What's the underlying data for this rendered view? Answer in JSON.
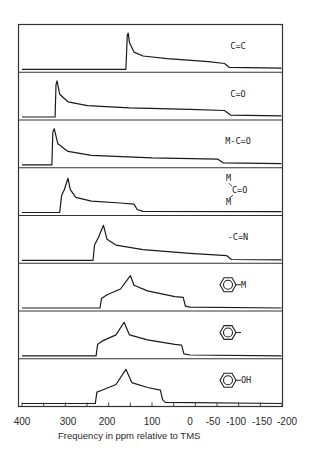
{
  "chart_data": {
    "type": "line",
    "title": "",
    "xlabel": "Frequency in ppm relative to TMS",
    "ylabel": "",
    "x_axis_reversed": true,
    "xlim": [
      400,
      -200
    ],
    "tick_labels": [
      "400",
      "300",
      "200",
      "100",
      "0",
      "-50",
      "-100",
      "-150",
      "-200"
    ],
    "tick_values": [
      400,
      300,
      200,
      100,
      0,
      -50,
      -100,
      -150,
      -200
    ],
    "minor_tick_count": 13,
    "grid": false,
    "legend": "none",
    "series": [
      {
        "name": "C=C",
        "label": "C=C",
        "label_kind": "text",
        "points": [
          [
            400,
            0
          ],
          [
            158,
            0
          ],
          [
            155,
            0.9
          ],
          [
            153,
            0.95
          ],
          [
            150,
            0.7
          ],
          [
            140,
            0.45
          ],
          [
            120,
            0.35
          ],
          [
            60,
            0.28
          ],
          [
            -40,
            0.2
          ],
          [
            -75,
            0.15
          ],
          [
            -85,
            0.05
          ],
          [
            -200,
            0.03
          ]
        ]
      },
      {
        "name": "C=O",
        "label": "C=O",
        "label_kind": "text",
        "points": [
          [
            400,
            0
          ],
          [
            328,
            0
          ],
          [
            326,
            0.85
          ],
          [
            324,
            0.95
          ],
          [
            318,
            0.6
          ],
          [
            300,
            0.4
          ],
          [
            250,
            0.3
          ],
          [
            150,
            0.24
          ],
          [
            0,
            0.2
          ],
          [
            -75,
            0.17
          ],
          [
            -88,
            0.05
          ],
          [
            -200,
            0.03
          ]
        ]
      },
      {
        "name": "M-C=O",
        "label": "M-C=O",
        "label_kind": "text",
        "points": [
          [
            400,
            0
          ],
          [
            335,
            0
          ],
          [
            333,
            0.85
          ],
          [
            330,
            0.95
          ],
          [
            322,
            0.55
          ],
          [
            300,
            0.35
          ],
          [
            240,
            0.25
          ],
          [
            100,
            0.18
          ],
          [
            -60,
            0.15
          ],
          [
            -72,
            0.05
          ],
          [
            -200,
            0.03
          ]
        ]
      },
      {
        "name": "M2C=O",
        "label": "M\\C=O/M",
        "label_kind": "bridged",
        "points": [
          [
            400,
            0
          ],
          [
            318,
            0
          ],
          [
            314,
            0.45
          ],
          [
            308,
            0.6
          ],
          [
            300,
            0.9
          ],
          [
            294,
            0.6
          ],
          [
            280,
            0.4
          ],
          [
            240,
            0.3
          ],
          [
            170,
            0.25
          ],
          [
            140,
            0.22
          ],
          [
            133,
            0.08
          ],
          [
            120,
            0.03
          ],
          [
            -200,
            0.02
          ]
        ]
      },
      {
        "name": "-C≡N",
        "label": "-C=N",
        "label_kind": "text",
        "points": [
          [
            400,
            0
          ],
          [
            236,
            0
          ],
          [
            232,
            0.4
          ],
          [
            222,
            0.6
          ],
          [
            209,
            0.92
          ],
          [
            200,
            0.55
          ],
          [
            180,
            0.4
          ],
          [
            120,
            0.28
          ],
          [
            0,
            0.18
          ],
          [
            -80,
            0.12
          ],
          [
            -90,
            0.02
          ],
          [
            -200,
            0.01
          ]
        ]
      },
      {
        "name": "Ph-M",
        "label": "M",
        "label_kind": "benzene",
        "points": [
          [
            400,
            0
          ],
          [
            218,
            0
          ],
          [
            214,
            0.25
          ],
          [
            200,
            0.35
          ],
          [
            170,
            0.5
          ],
          [
            148,
            0.85
          ],
          [
            140,
            0.6
          ],
          [
            110,
            0.45
          ],
          [
            40,
            0.3
          ],
          [
            18,
            0.28
          ],
          [
            12,
            0.05
          ],
          [
            0,
            0.02
          ],
          [
            -200,
            0
          ]
        ]
      },
      {
        "name": "Ph-",
        "label": "",
        "label_kind": "benzene",
        "points": [
          [
            400,
            0
          ],
          [
            228,
            0
          ],
          [
            224,
            0.3
          ],
          [
            210,
            0.4
          ],
          [
            180,
            0.55
          ],
          [
            162,
            0.88
          ],
          [
            150,
            0.55
          ],
          [
            110,
            0.42
          ],
          [
            40,
            0.3
          ],
          [
            22,
            0.28
          ],
          [
            16,
            0.05
          ],
          [
            0,
            0.02
          ],
          [
            -200,
            0
          ]
        ]
      },
      {
        "name": "Ph-OH",
        "label": "OH",
        "label_kind": "benzene",
        "points": [
          [
            400,
            0
          ],
          [
            230,
            0
          ],
          [
            226,
            0.3
          ],
          [
            210,
            0.36
          ],
          [
            180,
            0.5
          ],
          [
            158,
            0.9
          ],
          [
            145,
            0.55
          ],
          [
            110,
            0.42
          ],
          [
            78,
            0.35
          ],
          [
            72,
            0.1
          ],
          [
            65,
            0.03
          ],
          [
            -200,
            0
          ]
        ]
      }
    ]
  }
}
